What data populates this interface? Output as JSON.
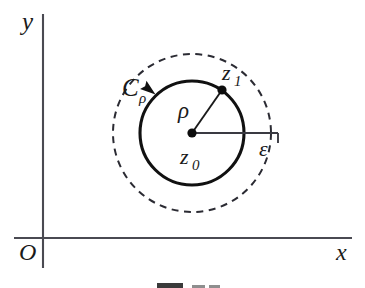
{
  "figure": {
    "axes": {
      "y_label": "y",
      "x_label": "x",
      "origin_label": "O"
    },
    "labels": {
      "contour": "C",
      "contour_subscript": "ρ",
      "radius_inner": "ρ",
      "radius_outer": "ε",
      "center_point": "z",
      "center_point_subscript": "0",
      "boundary_point": "z",
      "boundary_point_subscript": "1"
    },
    "geometry": {
      "center_x": 192,
      "center_y": 133,
      "inner_radius": 52,
      "outer_radius": 79,
      "point_z1_x": 222,
      "point_z1_y": 90,
      "x_axis_y": 238,
      "y_axis_x": 43,
      "orientation": "counterclockwise"
    },
    "colors": {
      "background": "#ffffff",
      "ink": "#111111",
      "axis": "#4a4a52",
      "dashed": "#2b2b33"
    }
  }
}
